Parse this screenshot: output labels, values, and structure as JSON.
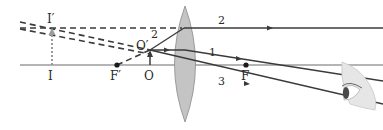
{
  "diagram": {
    "colors": {
      "ray": "#3a3a3a",
      "axis": "#6a6a6a",
      "lens_fill": "#c4c4c4",
      "lens_stroke": "#8a8a8a",
      "dashed": "#3a3a3a",
      "image_arrow": "#9a9a9a",
      "eye_skin": "#e6e6e6",
      "eye_iris": "#4a4a4a"
    },
    "labels": {
      "image_top": "I′",
      "image_base": "I",
      "focal_left": "F′",
      "object_base": "O",
      "object_top": "O′",
      "focal_right": "F",
      "ray1": "1",
      "ray2_right": "2",
      "ray2_left": "2",
      "ray3": "3"
    },
    "points": {
      "optical_axis_y": 65,
      "lens_center_x": 185,
      "I": [
        52,
        65
      ],
      "I_prime": [
        52,
        28
      ],
      "F_prime": [
        117,
        65
      ],
      "O": [
        150,
        65
      ],
      "O_prime": [
        150,
        50
      ],
      "F": [
        246,
        65
      ]
    },
    "rays": [
      {
        "id": "1",
        "desc": "parallel to axis from O′, refracts through F"
      },
      {
        "id": "2",
        "desc": "from O′ along line from F′, exits parallel to axis"
      },
      {
        "id": "3",
        "desc": "through lens center, undeviated"
      }
    ]
  }
}
